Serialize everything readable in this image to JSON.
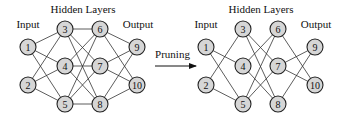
{
  "labels": {
    "input": "Input",
    "hidden": "Hidden Layers",
    "output": "Output",
    "arrow": "Pruning"
  },
  "nodes": {
    "1": {
      "label": "1",
      "dx": 28,
      "y": 47
    },
    "2": {
      "label": "2",
      "dx": 28,
      "y": 85
    },
    "3": {
      "label": "3",
      "dx": 65,
      "y": 29
    },
    "4": {
      "label": "4",
      "dx": 65,
      "y": 66
    },
    "5": {
      "label": "5",
      "dx": 65,
      "y": 104
    },
    "6": {
      "label": "6",
      "dx": 100,
      "y": 29
    },
    "7": {
      "label": "7",
      "dx": 100,
      "y": 66
    },
    "8": {
      "label": "8",
      "dx": 100,
      "y": 104
    },
    "9": {
      "label": "9",
      "dx": 137,
      "y": 47
    },
    "10": {
      "label": "10",
      "dx": 137,
      "y": 85
    }
  },
  "networks": [
    {
      "name": "original",
      "offset_x": 0,
      "edges": [
        [
          "1",
          "3"
        ],
        [
          "1",
          "4"
        ],
        [
          "1",
          "5"
        ],
        [
          "2",
          "3"
        ],
        [
          "2",
          "4"
        ],
        [
          "2",
          "5"
        ],
        [
          "3",
          "6"
        ],
        [
          "3",
          "7"
        ],
        [
          "3",
          "8"
        ],
        [
          "4",
          "6"
        ],
        [
          "4",
          "7"
        ],
        [
          "4",
          "8"
        ],
        [
          "5",
          "6"
        ],
        [
          "5",
          "7"
        ],
        [
          "5",
          "8"
        ],
        [
          "6",
          "9"
        ],
        [
          "6",
          "10"
        ],
        [
          "7",
          "9"
        ],
        [
          "7",
          "10"
        ],
        [
          "8",
          "9"
        ],
        [
          "8",
          "10"
        ]
      ]
    },
    {
      "name": "pruned",
      "offset_x": 178,
      "edges": [
        [
          "1",
          "4"
        ],
        [
          "1",
          "5"
        ],
        [
          "2",
          "3"
        ],
        [
          "2",
          "5"
        ],
        [
          "3",
          "7"
        ],
        [
          "3",
          "8"
        ],
        [
          "4",
          "6"
        ],
        [
          "4",
          "8"
        ],
        [
          "5",
          "6"
        ],
        [
          "5",
          "7"
        ],
        [
          "6",
          "10"
        ],
        [
          "7",
          "9"
        ],
        [
          "7",
          "10"
        ],
        [
          "8",
          "9"
        ]
      ]
    }
  ],
  "arrow": {
    "x1": 155,
    "x2": 196,
    "y": 66,
    "label_y": 58
  }
}
